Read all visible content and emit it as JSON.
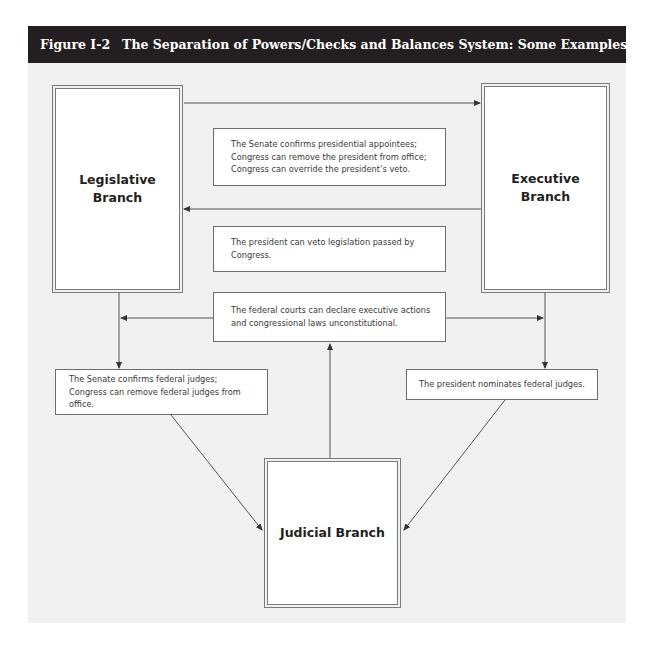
{
  "figure": {
    "number": "Figure I-2",
    "title": "The Separation of Powers/Checks and Balances System: Some Examples"
  },
  "branches": {
    "legislative": {
      "line1": "Legislative",
      "line2": "Branch"
    },
    "executive": {
      "line1": "Executive",
      "line2": "Branch"
    },
    "judicial": {
      "label": "Judicial Branch"
    }
  },
  "checks": {
    "legislative_on_executive": "The Senate confirms presidential appointees; Congress can remove the president from office; Congress can override the president’s veto.",
    "executive_on_legislative": "The president can veto legislation passed by Congress.",
    "judicial_on_both": "The federal courts can declare executive actions and congressional laws unconstitutional.",
    "legislative_on_judicial": "The Senate confirms federal judges; Congress can remove federal judges from office.",
    "executive_on_judicial": "The president nominates federal judges."
  },
  "colors": {
    "header_bg": "#231f20",
    "header_text": "#ffffff",
    "canvas_bg": "#f1f1f1",
    "box_bg": "#ffffff",
    "line": "#555555"
  }
}
